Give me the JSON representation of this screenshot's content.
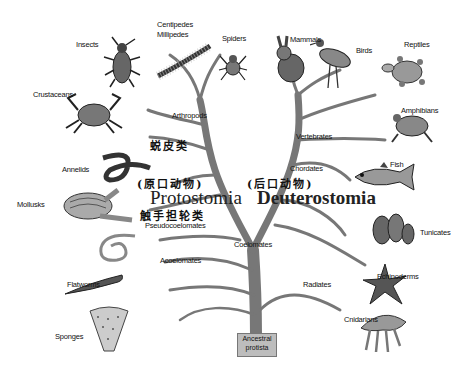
{
  "diagram": {
    "type": "phylogenetic-tree",
    "root": {
      "label_line1": "Ancestral",
      "label_line2": "protista"
    },
    "groups": {
      "protostomia": {
        "name": "Protostomia",
        "chinese": "(原口动物)"
      },
      "deuterostomia": {
        "name": "Deuterostomia",
        "chinese": "(后口动物)"
      }
    },
    "chinese_annotations": {
      "ecdysozoa": "蜕皮类",
      "lophotrochozoa": "触手担轮类"
    },
    "branch_labels": {
      "arthropods": "Arthropods",
      "vertebrates": "Vertebrates",
      "chordates": "Chordates",
      "pseudocoelomates": "Pseudocoelomates",
      "coelomates": "Coelomates",
      "acoelomates": "Acoelomates",
      "radiates": "Radiates"
    },
    "taxa": {
      "insects": "Insects",
      "centipedes": "Centipedes",
      "millipedes": "Millipedes",
      "spiders": "Spiders",
      "mammals": "Mammals",
      "birds": "Birds",
      "reptiles": "Reptiles",
      "crustaceans": "Crustaceans",
      "amphibians": "Amphibians",
      "annelids": "Annelids",
      "fish": "Fish",
      "mollusks": "Mollusks",
      "tunicates": "Tunicates",
      "echinoderms": "Echinoderms",
      "flatworms": "Flatworms",
      "cnidarians": "Cnidarians",
      "sponges": "Sponges"
    }
  }
}
